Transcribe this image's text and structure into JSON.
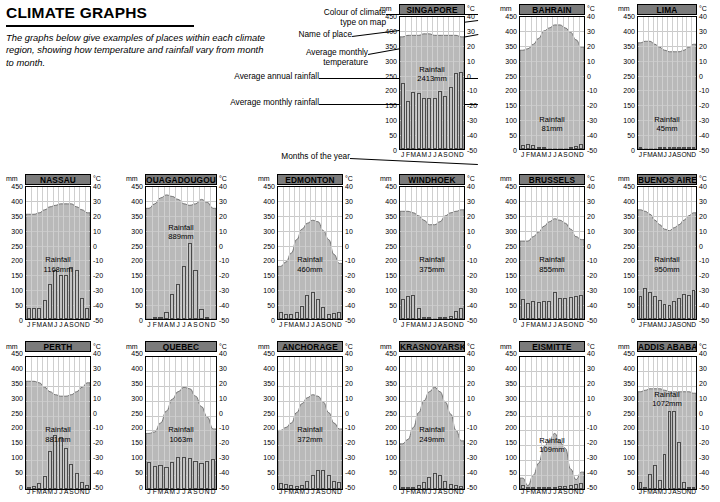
{
  "header": {
    "title": "CLIMATE GRAPHS",
    "intro": "The graphs below give examples of places within each climate region, showing how temperature and rainfall vary from month to month."
  },
  "annotations": [
    {
      "label": "Colour of climate\ntype on map"
    },
    {
      "label": "Name of place"
    },
    {
      "label": "Average monthly\ntemperature"
    },
    {
      "label": "Average annual rainfall"
    },
    {
      "label": "Average monthly rainfall"
    },
    {
      "label": "Months of the year"
    }
  ],
  "axis": {
    "left_unit": "mm",
    "right_unit": "°C",
    "rain_ticks": [
      "450",
      "400",
      "350",
      "300",
      "250",
      "200",
      "150",
      "100",
      "50",
      "0"
    ],
    "temp_ticks": [
      "40",
      "30",
      "20",
      "10",
      "0",
      "-10",
      "-20",
      "-30",
      "-40",
      "-50"
    ],
    "months": [
      "J",
      "F",
      "M",
      "A",
      "M",
      "J",
      "J",
      "A",
      "S",
      "O",
      "N",
      "D"
    ],
    "rain_range": [
      0,
      450
    ],
    "temp_range": [
      -50,
      40
    ]
  },
  "colors": {
    "title_band": "#7b7b7b",
    "temp_fill": "#b9b9b9",
    "bar_fill": "#c2c2c2",
    "bar_stroke": "#4a4a4a",
    "grid": "#c9c9c9"
  },
  "chart_data": [
    {
      "type": "bar",
      "title": "SINGAPORE",
      "rainfall_label": "Rainfall\n2413mm",
      "annual_rainfall_mm": 2413,
      "categories": [
        "J",
        "F",
        "M",
        "A",
        "M",
        "J",
        "J",
        "A",
        "S",
        "O",
        "N",
        "D"
      ],
      "series": [
        {
          "name": "Average monthly rainfall (mm)",
          "type": "bar",
          "values": [
            223,
            160,
            193,
            188,
            172,
            172,
            170,
            196,
            178,
            208,
            254,
            257
          ]
        },
        {
          "name": "Average monthly temperature (°C)",
          "type": "area",
          "values": [
            26,
            27,
            27,
            27,
            28,
            28,
            27,
            27,
            27,
            27,
            27,
            26
          ]
        }
      ],
      "xlabel": "",
      "ylabel": "mm",
      "y2label": "°C",
      "ylim": [
        0,
        450
      ],
      "y2lim": [
        -50,
        40
      ],
      "grid": true
    },
    {
      "type": "bar",
      "title": "BAHRAIN",
      "rainfall_label": "Rainfall\n81mm",
      "annual_rainfall_mm": 81,
      "categories": [
        "J",
        "F",
        "M",
        "A",
        "M",
        "J",
        "J",
        "A",
        "S",
        "O",
        "N",
        "D"
      ],
      "series": [
        {
          "name": "Average monthly rainfall (mm)",
          "type": "bar",
          "values": [
            14,
            16,
            14,
            8,
            1,
            0,
            0,
            0,
            0,
            1,
            10,
            17
          ]
        },
        {
          "name": "Average monthly temperature (°C)",
          "type": "area",
          "values": [
            17,
            18,
            21,
            25,
            30,
            32,
            34,
            34,
            32,
            29,
            24,
            19
          ]
        }
      ],
      "xlabel": "",
      "ylabel": "mm",
      "y2label": "°C",
      "ylim": [
        0,
        450
      ],
      "y2lim": [
        -50,
        40
      ],
      "grid": true
    },
    {
      "type": "bar",
      "title": "LIMA",
      "rainfall_label": "Rainfall\n45mm",
      "annual_rainfall_mm": 45,
      "categories": [
        "J",
        "F",
        "M",
        "A",
        "M",
        "J",
        "J",
        "A",
        "S",
        "O",
        "N",
        "D"
      ],
      "series": [
        {
          "name": "Average monthly rainfall (mm)",
          "type": "bar",
          "values": [
            1,
            0,
            0,
            0,
            1,
            5,
            8,
            8,
            8,
            3,
            2,
            1
          ]
        },
        {
          "name": "Average monthly temperature (°C)",
          "type": "area",
          "values": [
            22,
            23,
            23,
            21,
            19,
            17,
            16,
            16,
            16,
            17,
            19,
            21
          ]
        }
      ],
      "xlabel": "",
      "ylabel": "mm",
      "y2label": "°C",
      "ylim": [
        0,
        450
      ],
      "y2lim": [
        -50,
        40
      ],
      "grid": true
    },
    {
      "type": "bar",
      "title": "NASSAU",
      "rainfall_label": "Rainfall\n1168mm",
      "annual_rainfall_mm": 1168,
      "categories": [
        "J",
        "F",
        "M",
        "A",
        "M",
        "J",
        "J",
        "A",
        "S",
        "O",
        "N",
        "D"
      ],
      "series": [
        {
          "name": "Average monthly rainfall (mm)",
          "type": "bar",
          "values": [
            36,
            38,
            36,
            63,
            117,
            163,
            147,
            148,
            175,
            165,
            71,
            36
          ]
        },
        {
          "name": "Average monthly temperature (°C)",
          "type": "area",
          "values": [
            21,
            21,
            22,
            24,
            26,
            27,
            28,
            28,
            28,
            26,
            24,
            22
          ]
        }
      ],
      "xlabel": "",
      "ylabel": "mm",
      "y2label": "°C",
      "ylim": [
        0,
        450
      ],
      "y2lim": [
        -50,
        40
      ],
      "grid": true
    },
    {
      "type": "bar",
      "title": "OUAGADOUGOU",
      "rainfall_label": "Rainfall\n889mm",
      "annual_rainfall_mm": 889,
      "categories": [
        "J",
        "F",
        "M",
        "A",
        "M",
        "J",
        "J",
        "A",
        "S",
        "O",
        "N",
        "D"
      ],
      "series": [
        {
          "name": "Average monthly rainfall (mm)",
          "type": "bar",
          "values": [
            0,
            2,
            5,
            25,
            85,
            119,
            179,
            254,
            166,
            35,
            2,
            0
          ]
        },
        {
          "name": "Average monthly temperature (°C)",
          "type": "area",
          "values": [
            25,
            28,
            32,
            34,
            33,
            31,
            28,
            27,
            28,
            31,
            29,
            25
          ]
        }
      ],
      "xlabel": "",
      "ylabel": "mm",
      "y2label": "°C",
      "ylim": [
        0,
        450
      ],
      "y2lim": [
        -50,
        40
      ],
      "grid": true
    },
    {
      "type": "bar",
      "title": "EDMONTON",
      "rainfall_label": "Rainfall\n460mm",
      "annual_rainfall_mm": 460,
      "categories": [
        "J",
        "F",
        "M",
        "A",
        "M",
        "J",
        "J",
        "A",
        "S",
        "O",
        "N",
        "D"
      ],
      "series": [
        {
          "name": "Average monthly rainfall (mm)",
          "type": "bar",
          "values": [
            24,
            18,
            18,
            22,
            43,
            79,
            92,
            67,
            39,
            18,
            19,
            23
          ]
        },
        {
          "name": "Average monthly temperature (°C)",
          "type": "area",
          "values": [
            -14,
            -11,
            -5,
            4,
            11,
            15,
            17,
            16,
            10,
            4,
            -6,
            -12
          ]
        }
      ],
      "xlabel": "",
      "ylabel": "mm",
      "y2label": "°C",
      "ylim": [
        0,
        450
      ],
      "y2lim": [
        -50,
        40
      ],
      "grid": true
    },
    {
      "type": "bar",
      "title": "WINDHOEK",
      "rainfall_label": "Rainfall\n375mm",
      "annual_rainfall_mm": 375,
      "categories": [
        "J",
        "F",
        "M",
        "A",
        "M",
        "J",
        "J",
        "A",
        "S",
        "O",
        "N",
        "D"
      ],
      "series": [
        {
          "name": "Average monthly rainfall (mm)",
          "type": "bar",
          "values": [
            67,
            76,
            79,
            38,
            6,
            1,
            0,
            1,
            2,
            11,
            27,
            36
          ]
        },
        {
          "name": "Average monthly temperature (°C)",
          "type": "area",
          "values": [
            23,
            23,
            22,
            20,
            17,
            14,
            14,
            16,
            20,
            22,
            23,
            24
          ]
        }
      ],
      "xlabel": "",
      "ylabel": "mm",
      "y2label": "°C",
      "ylim": [
        0,
        450
      ],
      "y2lim": [
        -50,
        40
      ],
      "grid": true
    },
    {
      "type": "bar",
      "title": "BRUSSELS",
      "rainfall_label": "Rainfall\n855mm",
      "annual_rainfall_mm": 855,
      "categories": [
        "J",
        "F",
        "M",
        "A",
        "M",
        "J",
        "J",
        "A",
        "S",
        "O",
        "N",
        "D"
      ],
      "series": [
        {
          "name": "Average monthly rainfall (mm)",
          "type": "bar",
          "values": [
            66,
            54,
            62,
            56,
            62,
            60,
            90,
            72,
            70,
            74,
            78,
            81
          ]
        },
        {
          "name": "Average monthly temperature (°C)",
          "type": "area",
          "values": [
            3,
            3,
            6,
            9,
            13,
            16,
            18,
            17,
            15,
            11,
            6,
            4
          ]
        }
      ],
      "xlabel": "",
      "ylabel": "mm",
      "y2label": "°C",
      "ylim": [
        0,
        450
      ],
      "y2lim": [
        -50,
        40
      ],
      "grid": true
    },
    {
      "type": "bar",
      "title": "BUENOS AIRES",
      "rainfall_label": "Rainfall\n950mm",
      "annual_rainfall_mm": 950,
      "categories": [
        "J",
        "F",
        "M",
        "A",
        "M",
        "J",
        "J",
        "A",
        "S",
        "O",
        "N",
        "D"
      ],
      "series": [
        {
          "name": "Average monthly rainfall (mm)",
          "type": "bar",
          "values": [
            76,
            104,
            90,
            77,
            65,
            50,
            48,
            62,
            72,
            83,
            82,
            97
          ]
        },
        {
          "name": "Average monthly temperature (°C)",
          "type": "area",
          "values": [
            24,
            23,
            21,
            17,
            14,
            11,
            10,
            12,
            14,
            17,
            20,
            22
          ]
        }
      ],
      "xlabel": "",
      "ylabel": "mm",
      "y2label": "°C",
      "ylim": [
        0,
        450
      ],
      "y2lim": [
        -50,
        40
      ],
      "grid": true
    },
    {
      "type": "bar",
      "title": "PERTH",
      "rainfall_label": "Rainfall\n881mm",
      "annual_rainfall_mm": 881,
      "categories": [
        "J",
        "F",
        "M",
        "A",
        "M",
        "J",
        "J",
        "A",
        "S",
        "O",
        "N",
        "D"
      ],
      "series": [
        {
          "name": "Average monthly rainfall (mm)",
          "type": "bar",
          "values": [
            8,
            11,
            19,
            44,
            127,
            183,
            174,
            138,
            85,
            55,
            22,
            13
          ]
        },
        {
          "name": "Average monthly temperature (°C)",
          "type": "area",
          "values": [
            23,
            23,
            22,
            19,
            16,
            14,
            13,
            13,
            14,
            16,
            19,
            22
          ]
        }
      ],
      "xlabel": "",
      "ylabel": "mm",
      "y2label": "°C",
      "ylim": [
        0,
        450
      ],
      "y2lim": [
        -50,
        40
      ],
      "grid": true
    },
    {
      "type": "bar",
      "title": "QUEBEC",
      "rainfall_label": "Rainfall\n1063m",
      "annual_rainfall_mm": 1063,
      "categories": [
        "J",
        "F",
        "M",
        "A",
        "M",
        "J",
        "J",
        "A",
        "S",
        "O",
        "N",
        "D"
      ],
      "series": [
        {
          "name": "Average monthly rainfall (mm)",
          "type": "bar",
          "values": [
            90,
            78,
            79,
            75,
            92,
            108,
            107,
            105,
            94,
            87,
            95,
            100
          ]
        },
        {
          "name": "Average monthly temperature (°C)",
          "type": "area",
          "values": [
            -12,
            -11,
            -5,
            3,
            11,
            16,
            19,
            18,
            13,
            6,
            -1,
            -9
          ]
        }
      ],
      "xlabel": "",
      "ylabel": "mm",
      "y2label": "°C",
      "ylim": [
        0,
        450
      ],
      "y2lim": [
        -50,
        40
      ],
      "grid": true
    },
    {
      "type": "bar",
      "title": "ANCHORAGE",
      "rainfall_label": "Rainfall\n372mm",
      "annual_rainfall_mm": 372,
      "categories": [
        "J",
        "F",
        "M",
        "A",
        "M",
        "J",
        "J",
        "A",
        "S",
        "O",
        "N",
        "D"
      ],
      "series": [
        {
          "name": "Average monthly rainfall (mm)",
          "type": "bar",
          "values": [
            20,
            18,
            15,
            11,
            13,
            26,
            47,
            65,
            64,
            47,
            26,
            24
          ]
        },
        {
          "name": "Average monthly temperature (°C)",
          "type": "area",
          "values": [
            -10,
            -8,
            -5,
            2,
            8,
            12,
            14,
            13,
            9,
            2,
            -5,
            -9
          ]
        }
      ],
      "xlabel": "",
      "ylabel": "mm",
      "y2label": "°C",
      "ylim": [
        0,
        450
      ],
      "y2lim": [
        -50,
        40
      ],
      "grid": true
    },
    {
      "type": "bar",
      "title": "KRASNOYARSK",
      "rainfall_label": "Rainfall\n249mm",
      "annual_rainfall_mm": 249,
      "categories": [
        "J",
        "F",
        "M",
        "A",
        "M",
        "J",
        "J",
        "A",
        "S",
        "O",
        "N",
        "D"
      ],
      "series": [
        {
          "name": "Average monthly rainfall (mm)",
          "type": "bar",
          "values": [
            8,
            6,
            8,
            12,
            24,
            41,
            53,
            48,
            27,
            17,
            14,
            10
          ]
        },
        {
          "name": "Average monthly temperature (°C)",
          "type": "area",
          "values": [
            -19,
            -16,
            -8,
            2,
            10,
            16,
            19,
            16,
            9,
            1,
            -10,
            -17
          ]
        }
      ],
      "xlabel": "",
      "ylabel": "mm",
      "y2label": "°C",
      "ylim": [
        0,
        450
      ],
      "y2lim": [
        -50,
        40
      ],
      "grid": true
    },
    {
      "type": "bar",
      "title": "EISMITTE",
      "rainfall_label": "Rainfall\n109mm",
      "annual_rainfall_mm": 109,
      "categories": [
        "J",
        "F",
        "M",
        "A",
        "M",
        "J",
        "J",
        "A",
        "S",
        "O",
        "N",
        "D"
      ],
      "series": [
        {
          "name": "Average monthly rainfall (mm)",
          "type": "bar",
          "values": [
            15,
            5,
            8,
            5,
            3,
            2,
            3,
            10,
            11,
            12,
            16,
            19
          ]
        },
        {
          "name": "Average monthly temperature (°C)",
          "type": "area",
          "values": [
            -42,
            -47,
            -40,
            -32,
            -21,
            -17,
            -12,
            -18,
            -22,
            -36,
            -43,
            -38
          ]
        }
      ],
      "xlabel": "",
      "ylabel": "mm",
      "y2label": "°C",
      "ylim": [
        0,
        450
      ],
      "y2lim": [
        -50,
        40
      ],
      "grid": true
    },
    {
      "type": "bar",
      "title": "ADDIS ABABA",
      "rainfall_label": "Rainfall\n1072mm",
      "annual_rainfall_mm": 1072,
      "categories": [
        "J",
        "F",
        "M",
        "A",
        "M",
        "J",
        "J",
        "A",
        "S",
        "O",
        "N",
        "D"
      ],
      "series": [
        {
          "name": "Average monthly rainfall (mm)",
          "type": "bar",
          "values": [
            22,
            3,
            50,
            80,
            30,
            116,
            263,
            262,
            159,
            24,
            6,
            3
          ]
        },
        {
          "name": "Average monthly temperature (°C)",
          "type": "area",
          "values": [
            16,
            17,
            18,
            18,
            18,
            17,
            16,
            16,
            16,
            16,
            16,
            15
          ]
        }
      ],
      "xlabel": "",
      "ylabel": "mm",
      "y2label": "°C",
      "ylim": [
        0,
        450
      ],
      "y2lim": [
        -50,
        40
      ],
      "grid": true
    }
  ]
}
